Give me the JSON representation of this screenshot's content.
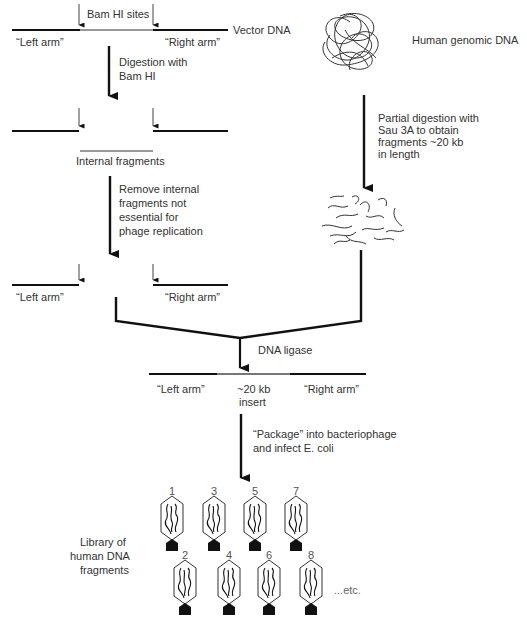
{
  "figure": {
    "colors": {
      "line": "#111111",
      "internal_fragment": "#888888",
      "text": "#333333"
    }
  },
  "vector": {
    "label": "Vector DNA",
    "sites_label": "Bam HI sites",
    "left_arm": "“Left arm”",
    "right_arm": "“Right arm”"
  },
  "step1": {
    "label_line1": "Digestion with",
    "label_line2": "Bam HI"
  },
  "internal": {
    "label": "Internal fragments"
  },
  "step2": {
    "line1": "Remove internal",
    "line2": "fragments not",
    "line3": "essential for",
    "line4": "phage replication"
  },
  "arms2": {
    "left_arm": "“Left arm”",
    "right_arm": "“Right arm”"
  },
  "genomic": {
    "label": "Human genomic DNA"
  },
  "partial": {
    "line1": "Partial digestion with",
    "line2": "Sau 3A to obtain",
    "line3": "fragments ~20 kb",
    "line4": "in length"
  },
  "ligase": {
    "label": "DNA ligase"
  },
  "recombinant": {
    "left_arm": "“Left arm”",
    "insert_line1": "~20 kb",
    "insert_line2": "insert",
    "right_arm": "“Right arm”"
  },
  "package": {
    "line1": "“Package” into bacteriophage",
    "line2": "and infect E. coli"
  },
  "library": {
    "line1": "Library of",
    "line2": "human DNA",
    "line3": "fragments",
    "etc": "...etc.",
    "phages_row1": [
      "1",
      "3",
      "5",
      "7"
    ],
    "phages_row2": [
      "2",
      "4",
      "6",
      "8"
    ]
  }
}
